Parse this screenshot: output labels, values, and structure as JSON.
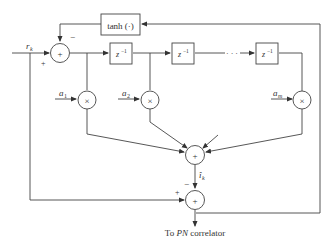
{
  "diagram": {
    "type": "block-diagram",
    "nonlinearity_block": {
      "label": "tanh (·)"
    },
    "delay_blocks": [
      {
        "label": "z",
        "exponent": "−1"
      },
      {
        "label": "z",
        "exponent": "−1"
      },
      {
        "label": "z",
        "exponent": "−1"
      }
    ],
    "ellipsis": "· · ·",
    "input_signal": {
      "label": "r",
      "subscript": "k"
    },
    "input_sum_signs": {
      "plus": "+",
      "minus": "−"
    },
    "coefficients": [
      {
        "label": "a",
        "subscript": "1"
      },
      {
        "label": "a",
        "subscript": "2"
      },
      {
        "label": "a",
        "subscript": "m"
      }
    ],
    "multiplier_symbol": "×",
    "adder_symbol": "+",
    "estimate_signal": {
      "label": "î",
      "subscript": "k"
    },
    "output_sum_signs": {
      "plus": "+",
      "minus": "−"
    },
    "output_label": {
      "prefix": "To ",
      "italic": "PN",
      "suffix": " correlator"
    }
  }
}
